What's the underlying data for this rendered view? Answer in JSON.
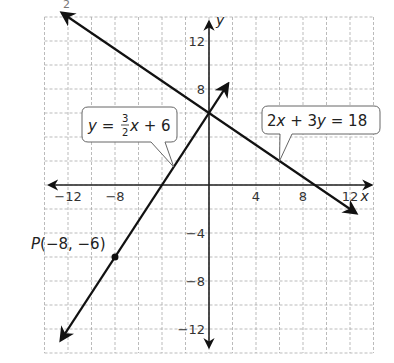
{
  "chart_data": {
    "type": "line",
    "title": "",
    "xlabel": "x",
    "ylabel": "y",
    "xlim": [
      -13.5,
      14
    ],
    "ylim": [
      -14,
      14
    ],
    "grid": true,
    "grid_step": 2,
    "x_ticks": [
      -12,
      -8,
      4,
      8,
      12
    ],
    "y_ticks": [
      12,
      8,
      -4,
      -8,
      -12
    ],
    "x_tick_labels": [
      "−12",
      "−8",
      "4",
      "8",
      "12"
    ],
    "y_tick_labels": [
      "12",
      "8",
      "−4",
      "−8",
      "−12"
    ],
    "series": [
      {
        "name": "y = 3/2 x + 6",
        "equation": "y = (3/2)x + 6",
        "slope": 1.5,
        "intercept": 6,
        "x_range": [
          -12.6,
          1.6
        ],
        "arrows": "both"
      },
      {
        "name": "2x + 3y = 18",
        "equation": "2x + 3y = 18",
        "slope": -0.6667,
        "intercept": 6,
        "x_range": [
          -12.5,
          12.5
        ],
        "arrows": "both"
      }
    ],
    "points": [
      {
        "label": "P(−8, −6)",
        "x": -8,
        "y": -6
      }
    ],
    "annotations": [
      {
        "text": "y = 3/2 x + 6",
        "target_x": -3,
        "target_y": 1.5
      },
      {
        "text": "2x + 3y = 18",
        "target_x": 6,
        "target_y": 2
      }
    ],
    "stray_text": "2"
  },
  "labels": {
    "ann1": {
      "y": "y",
      "eq": "=",
      "num": "3",
      "den": "2",
      "x": "x",
      "rest": "+ 6"
    },
    "ann2": {
      "a": "2",
      "x": "x",
      "plus": "+ 3",
      "y": "y",
      "eq": "= 18"
    },
    "point_label_p": "P",
    "point_label_coords": "(−8, −6)",
    "x_axis": "x",
    "y_axis": "y",
    "stray": "2"
  }
}
